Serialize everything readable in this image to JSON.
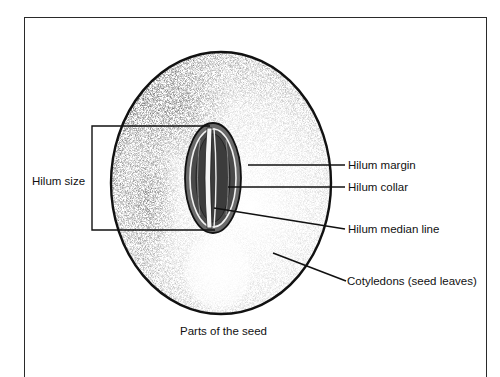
{
  "diagram": {
    "title": "Parts of the seed",
    "labels": {
      "hilum_size": "Hilum size",
      "hilum_margin": "Hilum margin",
      "hilum_collar": "Hilum collar",
      "hilum_median_line": "Hilum median line",
      "cotyledons": "Cotyledons (seed leaves)"
    },
    "colors": {
      "ink": "#111111",
      "seed_fill": "#d8d8d8",
      "seed_shadow": "#8a8a8a",
      "background": "#ffffff"
    }
  }
}
